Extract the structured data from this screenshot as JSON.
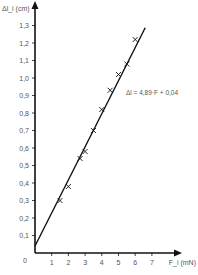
{
  "chart_data": {
    "type": "scatter",
    "title": "",
    "xlabel": "F_i (mN)",
    "ylabel": "Δl_i (cm)",
    "xlim": [
      0,
      7.5
    ],
    "ylim": [
      0,
      1.35
    ],
    "x_ticks": [
      "1",
      "2",
      "3",
      "4",
      "5",
      "6",
      "7"
    ],
    "y_ticks": [
      "0,1",
      "0,2",
      "0,3",
      "0,4",
      "0,5",
      "0,6",
      "0,7",
      "0,8",
      "0,9",
      "1,0",
      "1,1",
      "1,2",
      "1,3"
    ],
    "origin_label": "0",
    "grid": false,
    "series": [
      {
        "name": "measurements",
        "marker": "x",
        "x": [
          1.5,
          2.0,
          2.7,
          3.0,
          3.5,
          4.0,
          4.5,
          5.0,
          5.5,
          6.0
        ],
        "y": [
          0.3,
          0.38,
          0.54,
          0.58,
          0.7,
          0.82,
          0.93,
          1.02,
          1.08,
          1.22
        ]
      },
      {
        "name": "fit",
        "type": "line",
        "slope": 0.189,
        "intercept": 0.04
      }
    ],
    "annotations": [
      {
        "text": "Δl = 4,89·F + 0,04"
      }
    ]
  }
}
